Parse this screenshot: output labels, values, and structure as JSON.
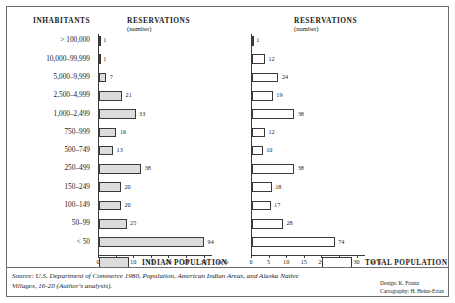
{
  "headers": {
    "inhabitants": "INHABITANTS",
    "reservations_left": "RESERVATIONS",
    "reservations_left_sub": "(number)",
    "reservations_right": "RESERVATIONS",
    "reservations_right_sub": "(number)"
  },
  "legend": {
    "indian_label": "INDIAN POPULATION",
    "total_label": "TOTAL POPULATION"
  },
  "footer": {
    "source": "Source: U.S. Department of Commerce 1980, Population, American Indian Areas, and Alaska Native Villages, 16-20 (Author's analysis).",
    "design": "Design: K. Frantz",
    "cartography": "Cartography: H. Heinz-Erian"
  },
  "axis": {
    "unit": "in %",
    "ticks": [
      0,
      5,
      10,
      15,
      20,
      25,
      30
    ]
  },
  "chart_data": {
    "type": "bar",
    "orientation": "horizontal",
    "categories": [
      "> 100,000",
      "10,000–99,999",
      "5,000–9,999",
      "2,500–4,999",
      "1,000–2,499",
      "750–999",
      "500–749",
      "250–499",
      "150–249",
      "100–149",
      "50–99",
      "< 50"
    ],
    "xlabel": "in %",
    "ylabel": "INHABITANTS",
    "xlim": [
      0,
      31
    ],
    "grid": false,
    "legend_position": "bottom",
    "series": [
      {
        "name": "INDIAN POPULATION",
        "unit": "number of reservations",
        "values": [
          1,
          1,
          7,
          21,
          33,
          16,
          13,
          38,
          20,
          20,
          25,
          94
        ]
      },
      {
        "name": "TOTAL POPULATION",
        "unit": "number of reservations",
        "values": [
          1,
          12,
          24,
          19,
          38,
          12,
          10,
          38,
          18,
          17,
          28,
          74
        ]
      }
    ]
  }
}
